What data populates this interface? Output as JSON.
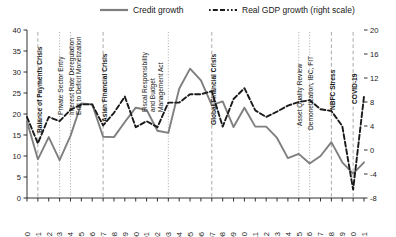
{
  "chart_data": {
    "type": "line",
    "title": "",
    "subtitle": "",
    "xlabel": "",
    "ylabel": "",
    "y2label": "",
    "grid": false,
    "legend_position": "top",
    "x": [
      1990,
      1991,
      1992,
      1993,
      1994,
      1995,
      1996,
      1997,
      1998,
      1999,
      2000,
      2001,
      2002,
      2003,
      2004,
      2005,
      2006,
      2007,
      2008,
      2009,
      2010,
      2011,
      2012,
      2013,
      2014,
      2015,
      2016,
      2017,
      2018,
      2019,
      2020,
      2021
    ],
    "xtick_labels": [
      "1990",
      "91",
      "92",
      "93",
      "94",
      "95",
      "96",
      "97",
      "98",
      "99",
      "2000",
      "01",
      "02",
      "03",
      "04",
      "05",
      "06",
      "07",
      "08",
      "09",
      "10",
      "11",
      "12",
      "13",
      "14",
      "15",
      "16",
      "17",
      "18",
      "19",
      "20",
      "21"
    ],
    "ylim": [
      0,
      40
    ],
    "yticks": [
      0,
      5,
      10,
      15,
      20,
      25,
      30,
      35,
      40
    ],
    "ytick_labels": [
      "0",
      "5",
      "10",
      "15",
      "20",
      "25",
      "30",
      "35",
      "40"
    ],
    "y2lim": [
      -8,
      20
    ],
    "y2ticks": [
      -8,
      -4,
      0,
      4,
      8,
      12,
      16,
      20
    ],
    "y2tick_labels": [
      "-8",
      "-4",
      "0",
      "4",
      "8",
      "12",
      "16",
      "20"
    ],
    "series": [
      {
        "name": "Credit growth",
        "axis": "left",
        "style": "solid",
        "color": "#7f7f7f",
        "values": [
          18.2,
          9.2,
          14.5,
          9.0,
          14.8,
          22.5,
          22.3,
          14.6,
          14.5,
          18.1,
          21.5,
          21.0,
          16.0,
          15.5,
          26.0,
          30.8,
          28.0,
          22.1,
          23.0,
          16.9,
          21.5,
          17.0,
          17.0,
          14.3,
          9.5,
          10.5,
          8.2,
          10.0,
          13.3,
          8.5,
          5.8,
          8.5
        ]
      },
      {
        "name": "Real GDP growth (right scale)",
        "axis": "right",
        "style": "dashed",
        "color": "#1a1a1a",
        "values": [
          5.5,
          1.1,
          5.5,
          4.8,
          6.7,
          7.6,
          7.6,
          4.1,
          6.2,
          8.9,
          3.8,
          4.8,
          3.8,
          7.9,
          7.9,
          9.3,
          9.3,
          9.8,
          3.9,
          8.5,
          10.3,
          6.6,
          5.5,
          6.4,
          7.4,
          8.0,
          8.3,
          6.8,
          6.5,
          4.0,
          -6.6,
          8.9
        ]
      }
    ],
    "event_markers": [
      {
        "year": 1991,
        "label": "Balance of Payments Crisis",
        "style": "dashed",
        "bold": true
      },
      {
        "year": 1993,
        "label": "Private Sector Entry",
        "style": "dotted",
        "bold": false
      },
      {
        "year": 1994,
        "label": "Interest Rate Deregulation",
        "style": "dotted",
        "bold": false
      },
      {
        "year": 1994,
        "label": "End to Deficit Monetization",
        "style": "none",
        "bold": false
      },
      {
        "year": 1997,
        "label": "Asian Financial Crisis",
        "style": "dashed",
        "bold": true
      },
      {
        "year": 2003,
        "label": "Fiscal Responsibility and Budget Management Act",
        "style": "dotted",
        "bold": false
      },
      {
        "year": 2007,
        "label": "Global Financial Crisis",
        "style": "dashed",
        "bold": true
      },
      {
        "year": 2015,
        "label": "Asset Quality Review",
        "style": "dotted",
        "bold": false
      },
      {
        "year": 2016,
        "label": "Demonetization, IBC, FIT",
        "style": "dotted",
        "bold": false
      },
      {
        "year": 2018,
        "label": "NBFC Stress",
        "style": "dashed",
        "bold": true
      },
      {
        "year": 2020,
        "label": "COVID-19",
        "style": "dashed",
        "bold": true
      }
    ]
  },
  "legend": {
    "items": [
      {
        "label": "Credit growth"
      },
      {
        "label": "Real GDP growth (right scale)"
      }
    ]
  }
}
